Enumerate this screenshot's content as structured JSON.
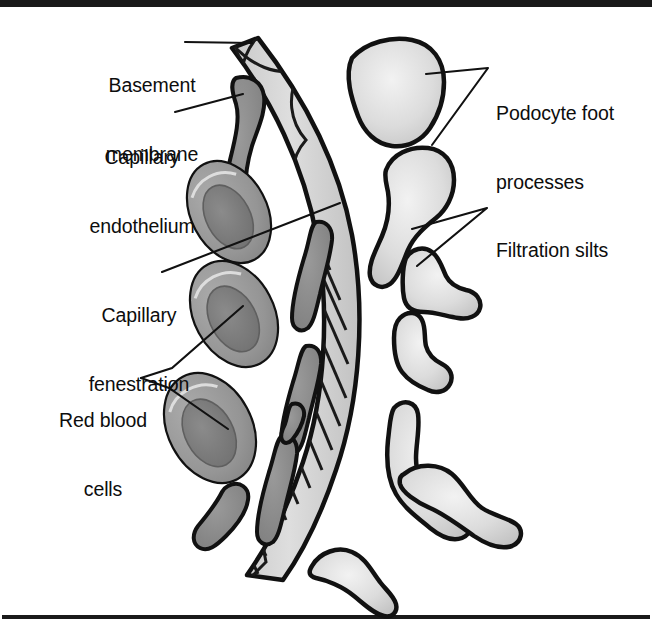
{
  "figure": {
    "title_visible": false,
    "background_color": "#ffffff",
    "frame": {
      "top_rule_color": "#1a1a1a",
      "bottom_rule_color": "#1a1a1a"
    },
    "palette": {
      "outline": "#111111",
      "basement_membrane_fill": "#d0d0d0",
      "basement_membrane_fiber": "#1a1a1a",
      "endothelium_fill": "#8a8a8a",
      "rbc_fill": "#9a9a9a",
      "rbc_dimple_fill": "#7d7d7d",
      "podocyte_fill": "#d9d9d9",
      "leader_line_color": "#111111",
      "text_color": "#0d0d0d"
    },
    "labels": [
      {
        "id": "basement-membrane",
        "lines": [
          "Basement",
          "membrane"
        ],
        "text": "Basement membrane",
        "align": "center",
        "x": 78,
        "y": 28,
        "width": 148
      },
      {
        "id": "capillary-endothelium",
        "lines": [
          "Capillary",
          "endothelium"
        ],
        "text": "Capillary endothelium",
        "align": "center",
        "x": 62,
        "y": 100,
        "width": 160
      },
      {
        "id": "capillary-fenestration",
        "lines": [
          "Capillary",
          "fenestration"
        ],
        "text": "Capillary fenestration",
        "align": "center",
        "x": 56,
        "y": 258,
        "width": 166
      },
      {
        "id": "red-blood-cells",
        "lines": [
          "Red blood",
          "cells"
        ],
        "text": "Red blood cells",
        "align": "center",
        "x": 30,
        "y": 363,
        "width": 146
      },
      {
        "id": "podocyte-foot-processes",
        "lines": [
          "Podocyte foot",
          "processes",
          ""
        ],
        "text": "Podocyte foot processes",
        "align": "left",
        "x": 496,
        "y": 56,
        "width": 150
      },
      {
        "id": "filtration-silts",
        "lines": [
          "Filtration silts"
        ],
        "text": "Filtration silts",
        "align": "left",
        "x": 496,
        "y": 193,
        "width": 150
      }
    ],
    "leader_lines": [
      {
        "id": "leader-basement-membrane",
        "from_label": "basement-membrane",
        "to_feature": "basement-membrane-band"
      },
      {
        "id": "leader-capillary-endothelium",
        "from_label": "capillary-endothelium",
        "to_feature": "endothelial-cell-upper"
      },
      {
        "id": "leader-capillary-fenestration",
        "from_label": "capillary-fenestration",
        "to_feature": "fenestration-gap"
      },
      {
        "id": "leader-red-blood-cells-a",
        "from_label": "red-blood-cells",
        "to_feature": "rbc-middle"
      },
      {
        "id": "leader-red-blood-cells-b",
        "from_label": "red-blood-cells",
        "to_feature": "rbc-lower"
      },
      {
        "id": "leader-podocyte-a",
        "from_label": "podocyte-foot-processes",
        "to_feature": "podocyte-top"
      },
      {
        "id": "leader-podocyte-b",
        "from_label": "podocyte-foot-processes",
        "to_feature": "podocyte-second"
      },
      {
        "id": "leader-filtration-a",
        "from_label": "filtration-silts",
        "to_feature": "slit-upper"
      },
      {
        "id": "leader-filtration-b",
        "from_label": "filtration-silts",
        "to_feature": "slit-lower"
      }
    ],
    "features": {
      "basement_membrane_count": 1,
      "endothelial_cell_count": 6,
      "red_blood_cell_count": 3,
      "podocyte_foot_process_count": 7
    }
  }
}
